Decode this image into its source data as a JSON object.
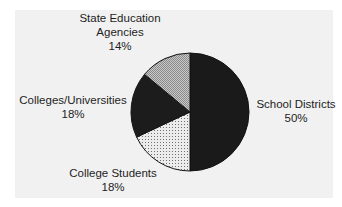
{
  "chart_data": {
    "type": "pie",
    "title": "",
    "start_angle": "12 o'clock",
    "direction": "clockwise",
    "legend": "none (direct labels)",
    "slices": [
      {
        "label": "School Districts",
        "value": 50,
        "value_label": "50%",
        "fill": "#1a1a1a",
        "pattern": "solid-dark"
      },
      {
        "label": "College Students",
        "value": 18,
        "value_label": "18%",
        "fill": "#e4e4e4",
        "pattern": "dots"
      },
      {
        "label": "Colleges/Universities",
        "value": 18,
        "value_label": "18%",
        "fill": "#1c1c1c",
        "pattern": "solid-dark"
      },
      {
        "label": "State Education Agencies",
        "value": 14,
        "value_label": "14%",
        "fill": "#b4b4b4",
        "pattern": "crosshatch"
      }
    ]
  },
  "labels": {
    "school_districts": {
      "name": "School Districts",
      "pct": "50%"
    },
    "college_students": {
      "name": "College Students",
      "pct": "18%"
    },
    "colleges_universities": {
      "name": "Colleges/Universities",
      "pct": "18%"
    },
    "state_agencies": {
      "line1": "State Education",
      "line2": "Agencies",
      "pct": "14%"
    }
  }
}
